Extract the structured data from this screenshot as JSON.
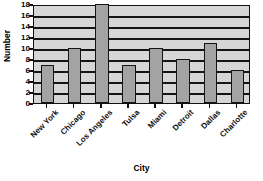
{
  "chart_data": {
    "type": "bar",
    "title": "in Selected Cities",
    "xlabel": "City",
    "ylabel": "Number",
    "categories": [
      "New York",
      "Chicago",
      "Los Angeles",
      "Tulsa",
      "Miami",
      "Detroit",
      "Dallas",
      "Charlotte"
    ],
    "values": [
      7,
      10,
      18,
      7,
      10,
      8,
      11,
      6
    ],
    "ylim": [
      0,
      18
    ],
    "ytick_labels": [
      "18",
      "16",
      "14",
      "12",
      "10",
      "8",
      "6",
      "4",
      "2",
      "0"
    ],
    "ytick_values": [
      18,
      16,
      14,
      12,
      10,
      8,
      6,
      4,
      2,
      0
    ],
    "ytick_step": 2,
    "grid": "horizontal",
    "legend": "none",
    "colors": {
      "bar_fill": "#a3a3a3",
      "bar_border": "#141414",
      "plot_background": "#d6d6d6",
      "gridline": "#151515",
      "axis": "#111111",
      "text": "#000000",
      "page_background": "#ffffff"
    }
  }
}
